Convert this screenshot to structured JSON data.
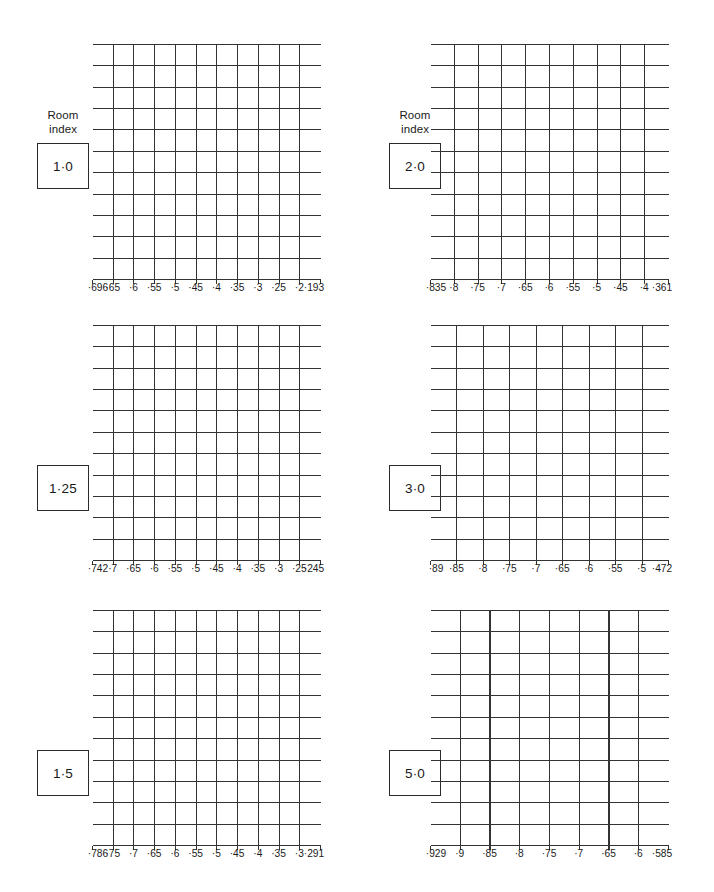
{
  "figure": {
    "type": "grid-chart-sheet",
    "panel_count": 6,
    "background_color": "#ffffff",
    "line_color": "#333333",
    "text_color": "#1a1a1a"
  },
  "caption": {
    "line1": "Room",
    "line2": "index"
  },
  "chart_data": [
    {
      "type": "table",
      "title": "Room index 1·0",
      "room_index": "1·0",
      "show_caption": true,
      "grid": {
        "columns": 11,
        "rows": 11,
        "grid_on": true
      },
      "xlabel": "",
      "ylabel": "",
      "xticks": [
        "·696",
        "·65",
        "·6",
        "·55",
        "·5",
        "·45",
        "·4",
        "·35",
        "·3",
        "·25",
        "·2",
        "·193"
      ],
      "xlim": [
        0.696,
        0.193
      ],
      "interior_ticks": [
        "·65",
        "·6",
        "·55",
        "·5",
        "·45",
        "·4",
        "·35",
        "·3",
        "·25",
        "·2"
      ],
      "end_ticks": [
        "·696",
        "·193"
      ]
    },
    {
      "type": "table",
      "title": "Room index 2·0",
      "room_index": "2·0",
      "show_caption": true,
      "grid": {
        "columns": 10,
        "rows": 11,
        "grid_on": true
      },
      "xlabel": "",
      "ylabel": "",
      "xticks": [
        "·835",
        "·8",
        "·75",
        "·7",
        "·65",
        "·6",
        "·55",
        "·5",
        "·45",
        "·4",
        "·361"
      ],
      "xlim": [
        0.835,
        0.361
      ],
      "interior_ticks": [
        "·8",
        "·75",
        "·7",
        "·65",
        "·6",
        "·55",
        "·5",
        "·45",
        "·4"
      ],
      "end_ticks": [
        "·835",
        "·361"
      ]
    },
    {
      "type": "table",
      "title": "Room index 1·25",
      "room_index": "1·25",
      "show_caption": false,
      "grid": {
        "columns": 11,
        "rows": 11,
        "grid_on": true
      },
      "xlabel": "",
      "ylabel": "",
      "xticks": [
        "·742",
        "·7",
        "·65",
        "·6",
        "·55",
        "·5",
        "·45",
        "·4",
        "·35",
        "·3",
        "·25",
        "·245"
      ],
      "xlim": [
        0.742,
        0.245
      ],
      "interior_ticks": [
        "·7",
        "·65",
        "·6",
        "·55",
        "·5",
        "·45",
        "·4",
        "·35",
        "·3",
        "·25"
      ],
      "end_ticks": [
        "·742",
        "·245"
      ]
    },
    {
      "type": "table",
      "title": "Room index 3·0",
      "room_index": "3·0",
      "show_caption": false,
      "grid": {
        "columns": 9,
        "rows": 11,
        "grid_on": true
      },
      "xlabel": "",
      "ylabel": "",
      "xticks": [
        "·89",
        "·85",
        "·8",
        "·75",
        "·7",
        "·65",
        "·6",
        "·55",
        "·5",
        "·472"
      ],
      "xlim": [
        0.89,
        0.472
      ],
      "interior_ticks": [
        "·85",
        "·8",
        "·75",
        "·7",
        "·65",
        "·6",
        "·55",
        "·5"
      ],
      "end_ticks": [
        "·89",
        "·472"
      ]
    },
    {
      "type": "table",
      "title": "Room index 1·5",
      "room_index": "1·5",
      "show_caption": false,
      "grid": {
        "columns": 11,
        "rows": 11,
        "grid_on": true
      },
      "xlabel": "",
      "ylabel": "",
      "xticks": [
        "·786",
        "·75",
        "·7",
        "·65",
        "·6",
        "·55",
        "·5",
        "·45",
        "·4",
        "·35",
        "·3",
        "·291"
      ],
      "xlim": [
        0.786,
        0.291
      ],
      "interior_ticks": [
        "·75",
        "·7",
        "·65",
        "·6",
        "·55",
        "·5",
        "·45",
        "·4",
        "·35",
        "·3"
      ],
      "end_ticks": [
        "·786",
        "·291"
      ]
    },
    {
      "type": "table",
      "title": "Room index 5·0",
      "room_index": "5·0",
      "show_caption": false,
      "grid": {
        "columns": 8,
        "rows": 11,
        "grid_on": true
      },
      "xlabel": "",
      "ylabel": "",
      "xticks": [
        "·929",
        "·9",
        "·85",
        "·8",
        "·75",
        "·7",
        "·65",
        "·6",
        "·585"
      ],
      "xlim": [
        0.929,
        0.585
      ],
      "interior_ticks": [
        "·9",
        "·85",
        "·8",
        "·75",
        "·7",
        "·65",
        "·6"
      ],
      "end_ticks": [
        "·929",
        "·585"
      ]
    }
  ]
}
